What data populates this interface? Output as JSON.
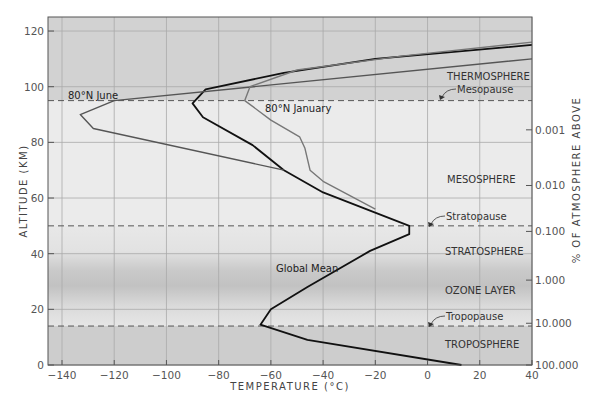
{
  "chart_data": {
    "type": "line",
    "title": "",
    "xlabel": "TEMPERATURE (°C)",
    "ylabel": "ALTITUDE (KM)",
    "y2label": "% OF ATMOSPHERE ABOVE",
    "xlim": [
      -145,
      40
    ],
    "ylim": [
      0,
      125
    ],
    "x_ticks": [
      -140,
      -120,
      -100,
      -80,
      -60,
      -40,
      -20,
      0,
      20,
      40
    ],
    "y_ticks": [
      0,
      20,
      40,
      60,
      80,
      100,
      120
    ],
    "y2_ticks": [
      {
        "altitude": 0,
        "label": "100.000"
      },
      {
        "altitude": 15,
        "label": "10.000"
      },
      {
        "altitude": 30.5,
        "label": "1.000"
      },
      {
        "altitude": 48,
        "label": "0.100"
      },
      {
        "altitude": 64.5,
        "label": "0.010"
      },
      {
        "altitude": 84.5,
        "label": "0.001"
      }
    ],
    "grid": true,
    "series": [
      {
        "name": "Global Mean",
        "color": "#111111",
        "points": [
          [
            13,
            0
          ],
          [
            -46,
            9
          ],
          [
            -64,
            14.5
          ],
          [
            -60,
            20
          ],
          [
            -46,
            28
          ],
          [
            -22,
            41
          ],
          [
            -7,
            47
          ],
          [
            -7,
            50
          ],
          [
            -40,
            62
          ],
          [
            -55,
            70
          ],
          [
            -67,
            79
          ],
          [
            -86,
            89
          ],
          [
            -90,
            94
          ],
          [
            -85,
            99
          ],
          [
            -55,
            105
          ],
          [
            -20,
            110
          ],
          [
            40,
            115
          ]
        ]
      },
      {
        "name": "80°N June",
        "color": "#555555",
        "points": [
          [
            -55,
            70
          ],
          [
            -128,
            85
          ],
          [
            -133,
            90
          ],
          [
            -120,
            95
          ],
          [
            40,
            110
          ]
        ]
      },
      {
        "name": "80°N January",
        "color": "#777777",
        "points": [
          [
            -20,
            56
          ],
          [
            -40,
            66
          ],
          [
            -45,
            70
          ],
          [
            -47,
            78
          ],
          [
            -49,
            82
          ],
          [
            -60,
            88
          ],
          [
            -70,
            95
          ],
          [
            -68,
            100
          ],
          [
            -50,
            106
          ],
          [
            -10,
            111
          ],
          [
            40,
            116
          ]
        ]
      }
    ],
    "boundaries": [
      {
        "name": "Tropopause",
        "altitude": 14
      },
      {
        "name": "Stratopause",
        "altitude": 50
      },
      {
        "name": "Mesopause",
        "altitude": 95
      }
    ],
    "layers": [
      {
        "name": "TROPOSPHERE",
        "altitude": 7
      },
      {
        "name": "OZONE LAYER",
        "altitude": 25
      },
      {
        "name": "STRATOSPHERE",
        "altitude": 40
      },
      {
        "name": "MESOSPHERE",
        "altitude": 67
      },
      {
        "name": "THERMOSPHERE",
        "altitude": 104
      }
    ],
    "annotations": [
      {
        "text": "80°N June",
        "x": -132,
        "y": 97
      },
      {
        "text": "80°N January",
        "x": -68,
        "y": 93
      },
      {
        "text": "Global Mean",
        "x": -60,
        "y": 35
      }
    ]
  },
  "labels": {
    "xlabel": "TEMPERATURE (°C)",
    "ylabel": "ALTITUDE (KM)",
    "y2label": "% OF ATMOSPHERE ABOVE",
    "troposphere": "TROPOSPHERE",
    "ozone": "OZONE LAYER",
    "stratosphere": "STRATOSPHERE",
    "mesosphere": "MESOSPHERE",
    "thermosphere": "THERMOSPHERE",
    "tropopause": "Tropopause",
    "stratopause": "Stratopause",
    "mesopause": "Mesopause",
    "june": "80°N June",
    "january": "80°N January",
    "global": "Global Mean"
  }
}
